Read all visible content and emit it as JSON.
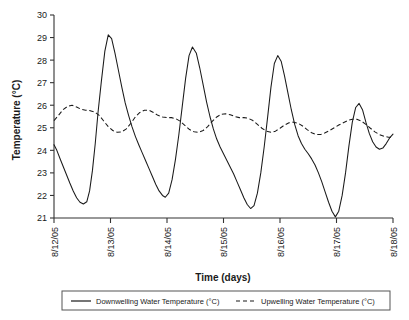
{
  "chart_data": {
    "type": "line",
    "title": "",
    "xlabel": "Time (days)",
    "ylabel": "Temperature (°C)",
    "ylim": [
      21,
      30
    ],
    "yticks": [
      21,
      22,
      23,
      24,
      25,
      26,
      27,
      28,
      29,
      30
    ],
    "xlim": [
      0,
      6
    ],
    "categories": [
      "8/12/05",
      "8/13/05",
      "8/14/05",
      "8/15/05",
      "8/16/05",
      "8/17/05",
      "8/18/05"
    ],
    "xticks": [
      0,
      1,
      2,
      3,
      4,
      5,
      6
    ],
    "grid": false,
    "legend_position": "bottom",
    "series": [
      {
        "name": "Downwelling Water Temperature (°C)",
        "style": "solid",
        "color": "#1a1a1a",
        "x": [
          0.0,
          0.05,
          0.12,
          0.2,
          0.28,
          0.34,
          0.4,
          0.46,
          0.52,
          0.58,
          0.63,
          0.68,
          0.73,
          0.78,
          0.84,
          0.9,
          0.96,
          1.02,
          1.08,
          1.14,
          1.2,
          1.26,
          1.32,
          1.38,
          1.44,
          1.5,
          1.56,
          1.62,
          1.68,
          1.74,
          1.8,
          1.86,
          1.92,
          1.97,
          2.03,
          2.09,
          2.15,
          2.21,
          2.27,
          2.33,
          2.39,
          2.45,
          2.52,
          2.58,
          2.64,
          2.7,
          2.76,
          2.82,
          2.88,
          2.94,
          3.0,
          3.06,
          3.12,
          3.18,
          3.24,
          3.3,
          3.36,
          3.42,
          3.48,
          3.54,
          3.6,
          3.66,
          3.72,
          3.78,
          3.84,
          3.9,
          3.96,
          4.02,
          4.08,
          4.14,
          4.2,
          4.26,
          4.32,
          4.38,
          4.44,
          4.5,
          4.56,
          4.62,
          4.68,
          4.74,
          4.8,
          4.86,
          4.92,
          4.98,
          5.04,
          5.1,
          5.16,
          5.22,
          5.28,
          5.34,
          5.4,
          5.46,
          5.52,
          5.58,
          5.64,
          5.7,
          5.76,
          5.82,
          5.88,
          5.94,
          6.0
        ],
        "y": [
          24.25,
          24.0,
          23.55,
          23.05,
          22.55,
          22.2,
          21.9,
          21.7,
          21.62,
          21.72,
          22.2,
          23.1,
          24.3,
          25.7,
          27.1,
          28.4,
          29.12,
          28.95,
          28.3,
          27.55,
          26.8,
          26.1,
          25.55,
          25.05,
          24.62,
          24.25,
          23.9,
          23.55,
          23.2,
          22.85,
          22.5,
          22.2,
          22.0,
          21.92,
          22.1,
          22.7,
          23.6,
          24.7,
          25.95,
          27.2,
          28.2,
          28.58,
          28.3,
          27.65,
          26.9,
          26.15,
          25.5,
          24.95,
          24.5,
          24.15,
          23.85,
          23.55,
          23.25,
          22.95,
          22.6,
          22.25,
          21.9,
          21.6,
          21.42,
          21.55,
          22.1,
          23.0,
          24.15,
          25.45,
          26.8,
          27.85,
          28.2,
          27.95,
          27.3,
          26.55,
          25.8,
          25.15,
          24.65,
          24.3,
          24.05,
          23.85,
          23.62,
          23.35,
          23.0,
          22.6,
          22.15,
          21.7,
          21.3,
          21.05,
          21.3,
          22.0,
          23.0,
          24.2,
          25.25,
          25.9,
          26.08,
          25.8,
          25.25,
          24.75,
          24.38,
          24.15,
          24.05,
          24.1,
          24.3,
          24.55,
          24.72
        ]
      },
      {
        "name": "Upwelling Water Temperature (°C)",
        "style": "dashed",
        "color": "#1a1a1a",
        "x": [
          0.0,
          0.08,
          0.16,
          0.24,
          0.32,
          0.4,
          0.48,
          0.56,
          0.64,
          0.72,
          0.8,
          0.88,
          0.96,
          1.04,
          1.12,
          1.2,
          1.28,
          1.36,
          1.44,
          1.52,
          1.6,
          1.68,
          1.76,
          1.84,
          1.92,
          2.0,
          2.08,
          2.16,
          2.24,
          2.32,
          2.4,
          2.48,
          2.56,
          2.64,
          2.72,
          2.8,
          2.88,
          2.96,
          3.04,
          3.12,
          3.2,
          3.28,
          3.36,
          3.44,
          3.52,
          3.6,
          3.68,
          3.76,
          3.84,
          3.92,
          4.0,
          4.08,
          4.16,
          4.24,
          4.32,
          4.4,
          4.48,
          4.56,
          4.64,
          4.72,
          4.8,
          4.88,
          4.96,
          5.04,
          5.12,
          5.2,
          5.28,
          5.36,
          5.44,
          5.52,
          5.6,
          5.68,
          5.76,
          5.84,
          5.92,
          6.0
        ],
        "y": [
          25.32,
          25.55,
          25.8,
          25.95,
          26.0,
          25.92,
          25.82,
          25.78,
          25.76,
          25.7,
          25.55,
          25.3,
          25.05,
          24.88,
          24.8,
          24.82,
          24.95,
          25.2,
          25.48,
          25.68,
          25.78,
          25.78,
          25.68,
          25.55,
          25.48,
          25.45,
          25.45,
          25.4,
          25.28,
          25.1,
          24.92,
          24.82,
          24.8,
          24.88,
          25.05,
          25.28,
          25.48,
          25.6,
          25.62,
          25.58,
          25.5,
          25.45,
          25.45,
          25.42,
          25.32,
          25.15,
          24.98,
          24.85,
          24.8,
          24.85,
          24.98,
          25.12,
          25.22,
          25.25,
          25.2,
          25.08,
          24.92,
          24.78,
          24.7,
          24.7,
          24.78,
          24.88,
          25.0,
          25.12,
          25.22,
          25.32,
          25.38,
          25.38,
          25.3,
          25.15,
          24.98,
          24.82,
          24.7,
          24.62,
          24.58,
          24.58
        ]
      }
    ]
  },
  "legend": {
    "items": [
      {
        "label": "Downwelling Water Temperature (°C)",
        "style": "solid"
      },
      {
        "label": "Upwelling Water Temperature (°C)",
        "style": "dashed"
      }
    ]
  },
  "axis": {
    "y_title": "Temperature (°C)",
    "x_title": "Time (days)",
    "y_tick_labels": [
      "30",
      "29",
      "28",
      "27",
      "26",
      "25",
      "24",
      "23",
      "22",
      "21"
    ],
    "x_tick_labels": [
      "8/12/05",
      "8/13/05",
      "8/14/05",
      "8/15/05",
      "8/16/05",
      "8/17/05",
      "8/18/05"
    ]
  },
  "colors": {
    "series_line": "#1a1a1a",
    "axis": "#333333",
    "background": "#ffffff"
  }
}
